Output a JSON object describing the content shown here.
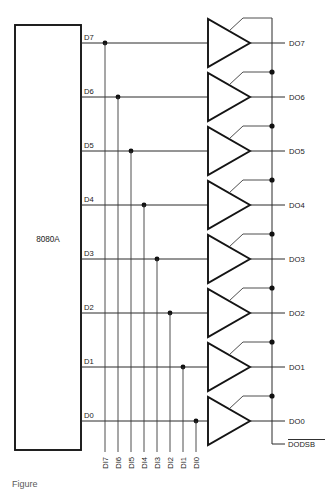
{
  "figure": {
    "type": "logic-schematic",
    "title_caption": "Figure",
    "chip": {
      "label": "8080A",
      "pin_side": "right"
    },
    "data_pins": [
      {
        "name": "D7",
        "y": 43
      },
      {
        "name": "D6",
        "y": 97
      },
      {
        "name": "D5",
        "y": 151
      },
      {
        "name": "D4",
        "y": 205
      },
      {
        "name": "D3",
        "y": 259
      },
      {
        "name": "D2",
        "y": 313
      },
      {
        "name": "D1",
        "y": 367
      },
      {
        "name": "D0",
        "y": 421
      }
    ],
    "outputs": [
      {
        "name": "DO7",
        "y": 43
      },
      {
        "name": "DO6",
        "y": 97
      },
      {
        "name": "DO5",
        "y": 151
      },
      {
        "name": "DO4",
        "y": 205
      },
      {
        "name": "DO3",
        "y": 259
      },
      {
        "name": "DO2",
        "y": 313
      },
      {
        "name": "DO1",
        "y": 367
      },
      {
        "name": "DO0",
        "y": 421
      }
    ],
    "input_bus": [
      {
        "name": "DI7",
        "x": 105
      },
      {
        "name": "DI6",
        "x": 118
      },
      {
        "name": "DI5",
        "x": 131
      },
      {
        "name": "DI4",
        "x": 144
      },
      {
        "name": "DI3",
        "x": 157
      },
      {
        "name": "DI2",
        "x": 170
      },
      {
        "name": "DI1",
        "x": 183
      },
      {
        "name": "DI0",
        "x": 196
      }
    ],
    "enable": {
      "label": "DODSB",
      "active_low": true,
      "overbar": true
    },
    "buffers": {
      "count": 8,
      "kind": "tri-state-buffer"
    },
    "colors": {
      "background": "#ffffff",
      "wire": "#2b2b2b",
      "outline": "#141414",
      "text": "#1a1a1a",
      "junction": "#111111"
    }
  }
}
